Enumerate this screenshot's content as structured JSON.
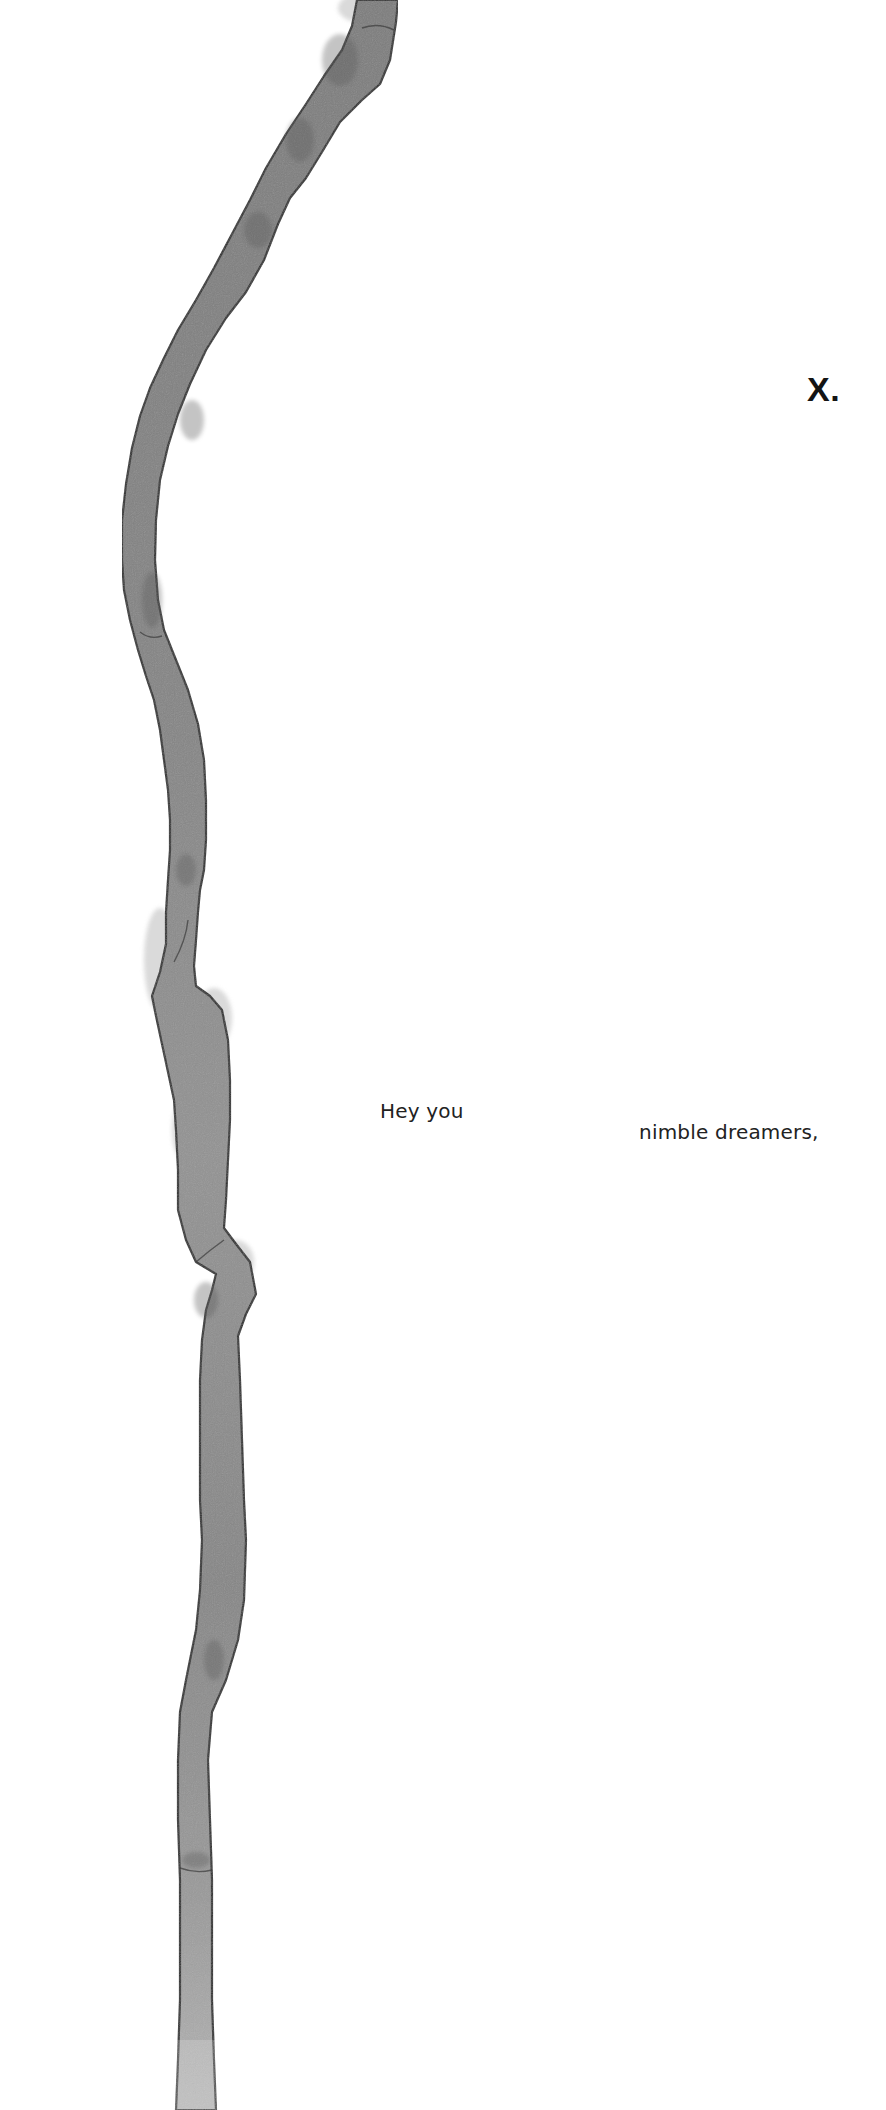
{
  "header": {
    "brand_mark": "X."
  },
  "intro": {
    "line_1": "Hey you",
    "line_2": "nimble dreamers,"
  },
  "artwork": {
    "icon": "ink-stroke-icon",
    "description": "vertical grey watercolor brush stroke",
    "colors": {
      "wash": "#8a8a8a",
      "wash_light": "#a9a9a9",
      "edge": "#2b2b2b",
      "halo": "#d4d4d4"
    }
  },
  "theme": {
    "background": "#ffffff",
    "text": "#222222"
  }
}
